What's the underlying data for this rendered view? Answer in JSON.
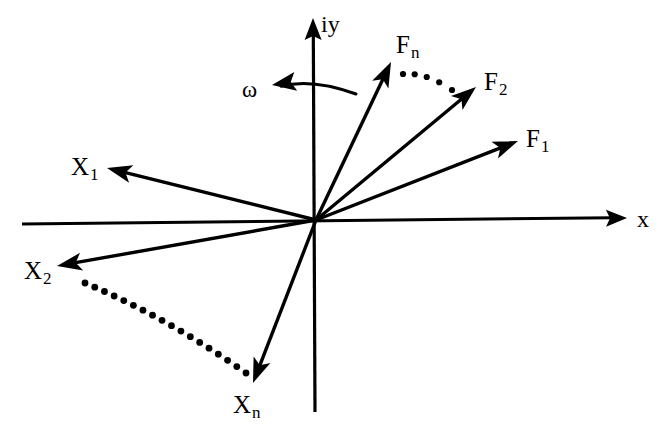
{
  "figure": {
    "kind": "phasor-diagram",
    "background_color": "#ffffff",
    "stroke_color": "#000000",
    "width": 664,
    "height": 429
  },
  "axes": {
    "origin": {
      "x": 316,
      "y": 220
    },
    "horizontal": {
      "label": "x",
      "label_pos": {
        "x": 637,
        "y": 207
      },
      "start": {
        "x": 22,
        "y": 224
      },
      "end": {
        "x": 627,
        "y": 218
      },
      "arrowhead": "end"
    },
    "vertical": {
      "label": "iy",
      "label_pos": {
        "x": 321,
        "y": 12
      },
      "start": {
        "x": 315,
        "y": 412
      },
      "end": {
        "x": 313,
        "y": 18
      },
      "arrowhead": "end"
    }
  },
  "rotation": {
    "symbol": "ω",
    "symbol_pos": {
      "x": 242,
      "y": 78
    },
    "arc": {
      "from": {
        "x": 356,
        "y": 94
      },
      "ctrl": {
        "x": 312,
        "y": 78
      },
      "to": {
        "x": 272,
        "y": 85
      },
      "arrowhead": "to",
      "direction": "counterclockwise"
    }
  },
  "force_vectors": [
    {
      "name": "F1",
      "label_base": "F",
      "label_sub": "1",
      "tip": {
        "x": 518,
        "y": 141
      },
      "label_pos": {
        "x": 526,
        "y": 126
      }
    },
    {
      "name": "F2",
      "label_base": "F",
      "label_sub": "2",
      "tip": {
        "x": 476,
        "y": 87
      },
      "label_pos": {
        "x": 484,
        "y": 69
      }
    },
    {
      "name": "Fn",
      "label_base": "F",
      "label_sub": "n",
      "tip": {
        "x": 391,
        "y": 62
      },
      "label_pos": {
        "x": 396,
        "y": 32
      }
    }
  ],
  "displacement_vectors": [
    {
      "name": "X1",
      "label_base": "X",
      "label_sub": "1",
      "tip": {
        "x": 107,
        "y": 168
      },
      "label_pos": {
        "x": 71,
        "y": 154
      }
    },
    {
      "name": "X2",
      "label_base": "X",
      "label_sub": "2",
      "tip": {
        "x": 57,
        "y": 266
      },
      "label_pos": {
        "x": 24,
        "y": 258
      }
    },
    {
      "name": "Xn",
      "label_base": "X",
      "label_sub": "n",
      "tip": {
        "x": 253,
        "y": 383
      },
      "label_pos": {
        "x": 233,
        "y": 392
      }
    }
  ],
  "dotted_connectors": [
    {
      "name": "fn-to-f2-dots",
      "from": {
        "x": 403,
        "y": 74
      },
      "ctrl": {
        "x": 426,
        "y": 72
      },
      "to": {
        "x": 452,
        "y": 90
      },
      "dot_count": 5,
      "dot_radius": 3.1
    },
    {
      "name": "x2-to-xn-dots",
      "from": {
        "x": 85,
        "y": 283
      },
      "ctrl": {
        "x": 168,
        "y": 318
      },
      "to": {
        "x": 246,
        "y": 373
      },
      "dot_count": 18,
      "dot_radius": 3.4
    }
  ]
}
